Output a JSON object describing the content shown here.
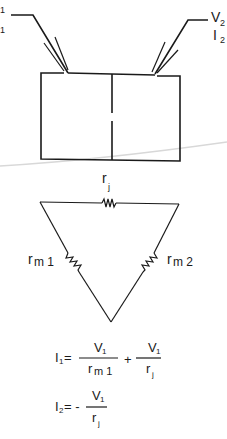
{
  "figure": {
    "block": {
      "left_terminal": {
        "voltage_label": "V",
        "voltage_sub": "1",
        "current_label": "I",
        "current_sub": "1"
      },
      "right_terminal": {
        "voltage_label": "V",
        "voltage_sub": "2",
        "current_label": "I",
        "current_sub": "2"
      }
    },
    "network": {
      "top_resistor": {
        "label": "r",
        "sub": "j"
      },
      "left_resistor": {
        "label": "r",
        "sub": "m 1"
      },
      "right_resistor": {
        "label": "r",
        "sub": "m 2"
      }
    },
    "equations": {
      "eq1": {
        "lhs": "I",
        "lhs_sub": "1",
        "equals": "=",
        "term1_num": "V",
        "term1_num_sub": "1",
        "term1_den": "r",
        "term1_den_sub": "m 1",
        "plus": "+",
        "term2_num": "V",
        "term2_num_sub": "1",
        "term2_den": "r",
        "term2_den_sub": "j"
      },
      "eq2": {
        "lhs": "I",
        "lhs_sub": "2",
        "equals": "= -",
        "num": "V",
        "num_sub": "1",
        "den": "r",
        "den_sub": "j"
      }
    }
  }
}
